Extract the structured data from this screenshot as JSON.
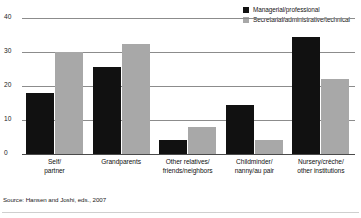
{
  "chart_data": {
    "type": "bar",
    "title": "",
    "subtitle": "",
    "xlabel": "",
    "ylabel": "",
    "ylim": [
      0,
      40
    ],
    "yticks": [
      0,
      10,
      20,
      30,
      40
    ],
    "grid": true,
    "legend_position": "top-right",
    "categories": [
      "Self/ partner",
      "Grandparents",
      "Other relatives/ friends/neighbors",
      "Childminder/ nanny/au pair",
      "Nursery/crèche/ other institutions"
    ],
    "category_lines": [
      [
        "Self/",
        "partner"
      ],
      [
        "Grandparents",
        ""
      ],
      [
        "Other relatives/",
        "friends/neighbors"
      ],
      [
        "Childminder/",
        "nanny/au pair"
      ],
      [
        "Nursery/crèche/",
        "other institutions"
      ]
    ],
    "series": [
      {
        "name": "Managerial/professional",
        "color": "#111111",
        "values": [
          18,
          25.5,
          4,
          14.5,
          34.5
        ]
      },
      {
        "name": "Secretarial/administrative/technical",
        "color": "#a8a8a8",
        "values": [
          30,
          32.5,
          8,
          4,
          22
        ]
      }
    ],
    "source": "Source: Hansen and Joshi, eds., 2007"
  },
  "legend": {
    "items": [
      {
        "label": "Managerial/professional",
        "swatch": "black"
      },
      {
        "label": "Secretarial/administrative/technical",
        "swatch": "gray"
      }
    ]
  },
  "axis": {
    "ytick_labels": [
      "40",
      "30",
      "20",
      "10",
      "0"
    ]
  },
  "footer": {
    "source": "Source: Hansen and Joshi, eds., 2007"
  }
}
